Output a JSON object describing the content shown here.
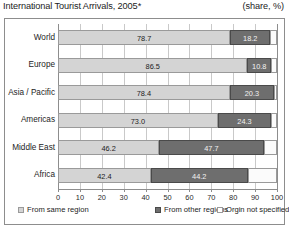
{
  "header": {
    "title": "International Tourist Arrivals, 2005*",
    "unit": "(share, %)"
  },
  "legend": [
    {
      "key": "same",
      "label": "From same region",
      "color": "#d4d4d4"
    },
    {
      "key": "other",
      "label": "From other regions",
      "color": "#6e6e6e"
    },
    {
      "key": "unspec",
      "label": "Orgin not specified",
      "color": "#ffffff"
    }
  ],
  "chart_data": {
    "type": "bar",
    "orientation": "horizontal",
    "stacked": true,
    "title": "International Tourist Arrivals, 2005*",
    "subtitle": "(share, %)",
    "xlabel": "",
    "ylabel": "",
    "xlim": [
      0,
      100
    ],
    "xticks": [
      0,
      10,
      20,
      30,
      40,
      50,
      60,
      70,
      80,
      90,
      100
    ],
    "grid": true,
    "legend_position": "bottom",
    "categories": [
      "World",
      "Europe",
      "Asia / Pacific",
      "Americas",
      "Middle East",
      "Africa"
    ],
    "series": [
      {
        "name": "From same region",
        "values": [
          78.7,
          86.5,
          78.4,
          73.0,
          46.2,
          42.4
        ]
      },
      {
        "name": "From other regions",
        "values": [
          18.2,
          10.8,
          20.3,
          24.3,
          47.7,
          44.2
        ]
      },
      {
        "name": "Orgin not specified",
        "values": [
          3.1,
          2.7,
          1.3,
          2.7,
          6.1,
          13.4
        ]
      }
    ],
    "data_labels": {
      "From same region": [
        "78.7",
        "86.5",
        "78.4",
        "73.0",
        "46.2",
        "42.4"
      ],
      "From other regions": [
        "18.2",
        "10.8",
        "20.3",
        "24.3",
        "47.7",
        "44.2"
      ],
      "Orgin not specified": [
        "",
        "",
        "",
        "",
        "",
        ""
      ]
    },
    "footnote": "*"
  }
}
